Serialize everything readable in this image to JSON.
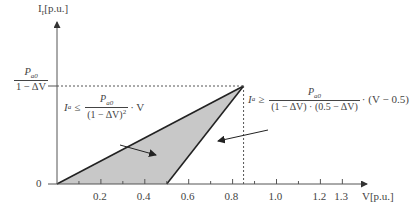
{
  "chart_data": {
    "type": "area",
    "title": "",
    "xlabel": "V[p.u.]",
    "ylabel": "I_r[p.u.]",
    "xlim": [
      0,
      1.4
    ],
    "x_ticks": [
      0.2,
      0.4,
      0.6,
      0.8,
      1.0,
      1.2,
      1.3
    ],
    "x_tick_labels": [
      "0.2",
      "0.4",
      "0.6",
      "0.8",
      "1.0",
      "1.2",
      "1.3"
    ],
    "y_tick_labels": [
      "0"
    ],
    "region": {
      "name": "feasible region",
      "vertices": [
        [
          0,
          0
        ],
        [
          0.5,
          0
        ],
        [
          0.85,
          1
        ]
      ],
      "fill": "#c8c8c8"
    },
    "reference_lines": [
      {
        "type": "horizontal",
        "label": "Pa0 / (1 − ΔV)",
        "y": 1
      },
      {
        "type": "vertical",
        "x": 0.85
      }
    ],
    "annotations": [
      {
        "text": "Ia ≤ Pa0 / (1 − ΔV)² · V",
        "points_to": "upper edge"
      },
      {
        "text": "Ia ≥ Pa0 / ((1 − ΔV)·(0.5 − ΔV)) · (V − 0.5)",
        "points_to": "lower edge"
      }
    ]
  },
  "labels": {
    "y_axis": "I",
    "y_axis_sub": "r",
    "y_axis_unit": "[p.u.]",
    "x_axis": "V[p.u.]",
    "zero": "0",
    "ylevel_num": "P",
    "ylevel_num_sub": "a0",
    "ylevel_den": "1 − ΔV",
    "eq1_lhs": "I",
    "eq1_lhs_sub": "a",
    "eq1_op": "≤",
    "eq1_num": "P",
    "eq1_num_sub": "a0",
    "eq1_den": "(1 − ΔV)",
    "eq1_den_sup": "2",
    "eq1_tail": "· V",
    "eq2_lhs": "I",
    "eq2_lhs_sub": "a",
    "eq2_op": "≥",
    "eq2_num": "P",
    "eq2_num_sub": "a0",
    "eq2_den": "(1 − ΔV) · (0.5 − ΔV)",
    "eq2_tail": "· (V − 0.5)"
  },
  "colors": {
    "fill": "#c8c8c8",
    "line": "#222222",
    "axis": "#555555"
  }
}
